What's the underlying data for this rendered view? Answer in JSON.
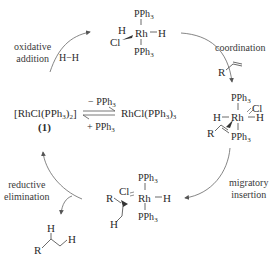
{
  "diagram": {
    "type": "catalytic-cycle",
    "colors": {
      "ink": "#2b2b2b",
      "arrow": "#555555",
      "background": "#ffffff"
    },
    "center": {
      "catalyst_label": "[RhCl(PPh3)2]",
      "catalyst_number": "(1)",
      "equilibrium_top": "− PPh3",
      "equilibrium_bottom": "+ PPh3",
      "precursor": "RhCl(PPh3)3"
    },
    "steps": [
      {
        "id": "oxidative-addition",
        "line1": "oxidative",
        "line2": "addition",
        "reagent": "H−H"
      },
      {
        "id": "coordination",
        "line1": "coordination"
      },
      {
        "id": "migratory-insertion",
        "line1": "migratory",
        "line2": "insertion"
      },
      {
        "id": "reductive-elimination",
        "line1": "reductive",
        "line2": "elimination"
      }
    ],
    "intermediates": {
      "dihydride": {
        "top": "PPh3",
        "bottom": "PPh3",
        "metal": "Rh",
        "h_left": "H",
        "h_right": "H",
        "cl": "Cl"
      },
      "alkene_complex": {
        "top": "PPh3",
        "bottom": "PPh3",
        "metal": "Rh",
        "h_left": "H",
        "h_right": "H",
        "cl": "Cl",
        "r": "R"
      },
      "alkyl_hydride": {
        "top": "PPh3",
        "bottom": "PPh3",
        "metal": "Rh",
        "h_right": "H",
        "cl": "Cl",
        "r": "R",
        "h_chain": "H"
      }
    },
    "substrate": {
      "r": "R"
    },
    "product": {
      "r": "R",
      "h1": "H",
      "h2": "H"
    }
  }
}
